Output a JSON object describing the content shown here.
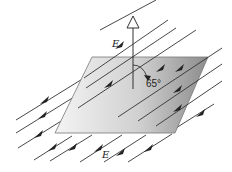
{
  "diagram": {
    "labels": {
      "field_top": "E",
      "field_bottom": "E",
      "angle": "65°"
    },
    "elements": {
      "surface": "flat parallelogram plane, gray gradient",
      "normal_vector": "open-headed arrow pointing up from plane",
      "field_lines": "parallel diagonal lines with arrowheads pointing down-left",
      "angle_arc": "arc with arrowhead from normal toward field direction"
    },
    "colors": {
      "line": "#333333",
      "plane_light": "#f2f2f2",
      "plane_dark": "#8a8a8a",
      "background": "#ffffff"
    }
  }
}
